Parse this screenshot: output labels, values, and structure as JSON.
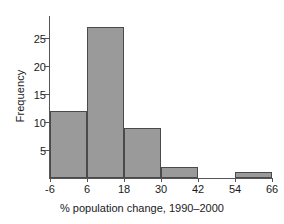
{
  "chart_data": {
    "type": "bar",
    "title": "",
    "subtitle": "",
    "xlabel": "% population change, 1990–2000",
    "ylabel": "Frequency",
    "categories": [
      "-6 to 6",
      "6 to 18",
      "18 to 30",
      "30 to 42",
      "42 to 54",
      "54 to 66"
    ],
    "bin_edges": [
      -6,
      6,
      18,
      30,
      42,
      54,
      66
    ],
    "values": [
      12,
      27,
      9,
      2,
      0,
      1
    ],
    "bin_width": 12,
    "xlim": [
      -6,
      66
    ],
    "ylim": [
      0,
      29
    ],
    "xticks": [
      -6,
      6,
      18,
      30,
      42,
      54,
      66
    ],
    "xtick_labels": [
      "-6",
      "6",
      "18",
      "30",
      "42",
      "54",
      "66"
    ],
    "yticks": [
      5,
      10,
      15,
      20,
      25
    ],
    "ytick_labels": [
      "5",
      "10",
      "15",
      "20",
      "25"
    ],
    "grid": false,
    "legend": "none",
    "bar_fill_color": "#9a9a9a",
    "bar_edge_color": "#4a4a4a",
    "axis_color": "#555555",
    "background_color": "#ffffff"
  }
}
